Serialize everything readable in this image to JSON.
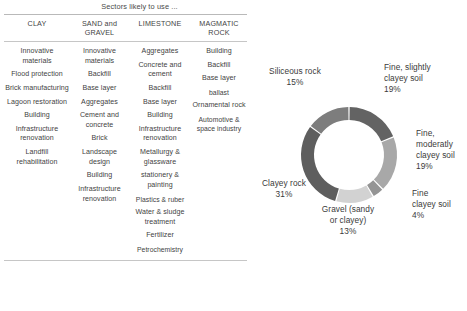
{
  "table": {
    "title": "Sectors likely to use ...",
    "columns": [
      {
        "header": "CLAY"
      },
      {
        "header": "SAND and GRAVEL"
      },
      {
        "header": "LIMESTONE"
      },
      {
        "header": "MAGMATIC ROCK"
      }
    ],
    "cells": {
      "clay": [
        "Innovative materials",
        "Flood protection",
        "Brick manufacturing",
        "Lagoon restoration",
        "Building",
        "Infrastructure renovation",
        "Landfill rehabilitation"
      ],
      "sand_and_gravel": [
        "Innovative materials",
        "Backfill",
        "Base layer",
        "Aggregates",
        "Cement and concrete",
        "Brick",
        "Landscape design",
        "Building",
        "Infrastructure renovation"
      ],
      "limestone": [
        "Aggregates",
        "Concrete and cement",
        "Backfill",
        "Base layer",
        "Building",
        "Infrastructure renovation",
        "Metallurgy & glassware",
        "stationery & painting",
        "Plastics & ruber",
        "Water & sludge treatment",
        "Fertilizer",
        "Petrochemistry"
      ],
      "magmatic_rock": [
        "Building",
        "Backfill",
        "Base layer",
        "ballast",
        "Ornamental rock",
        "Automotive & space industry"
      ]
    }
  },
  "chart_data": {
    "type": "pie",
    "variant": "donut",
    "title": "",
    "xlabel": "",
    "ylabel": "",
    "legend_position": "none",
    "labels_outside": true,
    "start_angle_deg": 0,
    "direction": "clockwise",
    "categories": [
      "Fine, slightly clayey soil",
      "Fine, moderatly clayey soil",
      "Fine clayey soil",
      "Gravel (sandy or clayey)",
      "Clayey rock",
      "Siliceous rock"
    ],
    "values": [
      19,
      19,
      4,
      13,
      31,
      15
    ],
    "value_labels": [
      "19%",
      "19%",
      "4%",
      "13%",
      "31%",
      "15%"
    ],
    "colors": [
      "#636363",
      "#a8a8a8",
      "#949494",
      "#d2d2d2",
      "#5e5e5e",
      "#7d7d7d"
    ],
    "annotations": [
      {
        "name": "siliceous-rock",
        "text": "Siliceous rock",
        "pct": "15%"
      },
      {
        "name": "fine-slightly-clayey-soil",
        "text": "Fine, slightly clayey soil",
        "pct": "19%"
      },
      {
        "name": "fine-moderatly-clayey-soil",
        "text": "Fine, moderatly clayey soil",
        "pct": "19%"
      },
      {
        "name": "fine-clayey-soil",
        "text": "Fine clayey soil",
        "pct": "4%"
      },
      {
        "name": "gravel-sandy-or-clayey",
        "text": "Gravel (sandy or clayey)",
        "pct": "13%"
      },
      {
        "name": "clayey-rock",
        "text": "Clayey rock",
        "pct": "31%"
      }
    ]
  },
  "labels": {
    "siliceous": {
      "l1": "Siliceous rock",
      "pct": "15%"
    },
    "slightly": {
      "l1": "Fine, slightly",
      "l2": "clayey soil",
      "pct": "19%"
    },
    "moderately": {
      "l1": "Fine,",
      "l2": "moderatly",
      "l3": "clayey soil",
      "pct": "19%"
    },
    "fineclayey": {
      "l1": "Fine",
      "l2": "clayey soil",
      "pct": "4%"
    },
    "gravel": {
      "l1": "Gravel (sandy",
      "l2": "or clayey)",
      "pct": "13%"
    },
    "clayeyrock": {
      "l1": "Clayey rock",
      "pct": "31%"
    }
  }
}
